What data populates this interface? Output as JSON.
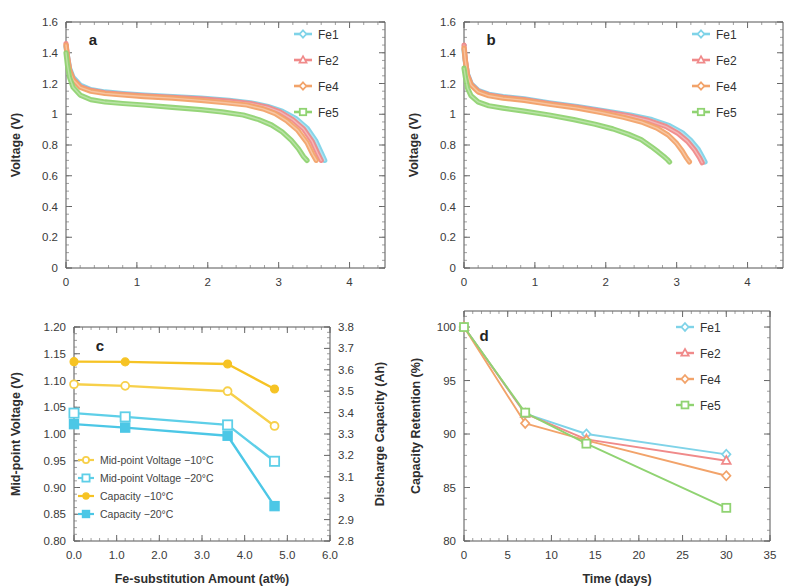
{
  "figure": {
    "panels": [
      "a",
      "b",
      "c",
      "d"
    ]
  },
  "colors": {
    "fe1": "#7fd3e8",
    "fe2": "#f08a8a",
    "fe4": "#f2a36a",
    "fe5": "#90d372",
    "midpoint_10": "#f7d04a",
    "midpoint_20": "#5ecfe8",
    "capacity_10": "#f6c324",
    "capacity_20": "#4cc7e6",
    "axis": "#555555",
    "text": "#333333"
  },
  "panel_a": {
    "letter": "a",
    "legend": [
      "Fe1",
      "Fe2",
      "Fe4",
      "Fe5"
    ],
    "chart_data": {
      "type": "line",
      "title": "",
      "xlabel": "Discharge Capacity (Ah)",
      "ylabel": "Voltage (V)",
      "xlim": [
        0,
        4.5
      ],
      "ylim": [
        0,
        1.6
      ],
      "xticks": [
        0,
        1,
        2,
        3,
        4
      ],
      "xtick_labels": [
        "0",
        "1",
        "2",
        "3",
        "4"
      ],
      "yticks": [
        0,
        0.2,
        0.4,
        0.6,
        0.8,
        1.0,
        1.2,
        1.4,
        1.6
      ],
      "ytick_labels": [
        "0",
        "0.2",
        "0.4",
        "0.6",
        "0.8",
        "1",
        "1.2",
        "1.4",
        "1.6"
      ],
      "grid": false,
      "legend_position": "top-right",
      "series": [
        {
          "name": "Fe1",
          "color": "#7fd3e8",
          "x": [
            0.0,
            0.02,
            0.05,
            0.1,
            0.2,
            0.35,
            0.55,
            0.8,
            1.1,
            1.5,
            1.9,
            2.3,
            2.6,
            2.85,
            3.05,
            3.25,
            3.4,
            3.52,
            3.6,
            3.65
          ],
          "y": [
            1.44,
            1.38,
            1.3,
            1.24,
            1.19,
            1.16,
            1.145,
            1.135,
            1.125,
            1.115,
            1.105,
            1.09,
            1.075,
            1.05,
            1.02,
            0.97,
            0.91,
            0.83,
            0.75,
            0.7
          ]
        },
        {
          "name": "Fe2",
          "color": "#f08a8a",
          "x": [
            0.0,
            0.02,
            0.05,
            0.1,
            0.2,
            0.35,
            0.55,
            0.8,
            1.1,
            1.5,
            1.9,
            2.3,
            2.6,
            2.85,
            3.02,
            3.2,
            3.35,
            3.47,
            3.55,
            3.6
          ],
          "y": [
            1.46,
            1.38,
            1.29,
            1.23,
            1.18,
            1.155,
            1.14,
            1.13,
            1.12,
            1.11,
            1.1,
            1.085,
            1.07,
            1.045,
            1.015,
            0.965,
            0.905,
            0.825,
            0.745,
            0.7
          ]
        },
        {
          "name": "Fe4",
          "color": "#f2a36a",
          "x": [
            0.0,
            0.02,
            0.05,
            0.1,
            0.2,
            0.35,
            0.55,
            0.8,
            1.1,
            1.5,
            1.9,
            2.25,
            2.55,
            2.78,
            2.95,
            3.12,
            3.27,
            3.4,
            3.48,
            3.53
          ],
          "y": [
            1.45,
            1.37,
            1.285,
            1.225,
            1.175,
            1.15,
            1.135,
            1.125,
            1.115,
            1.105,
            1.09,
            1.075,
            1.06,
            1.035,
            1.005,
            0.955,
            0.895,
            0.815,
            0.74,
            0.7
          ]
        },
        {
          "name": "Fe5",
          "color": "#90d372",
          "x": [
            0.0,
            0.02,
            0.05,
            0.1,
            0.2,
            0.35,
            0.55,
            0.8,
            1.1,
            1.5,
            1.9,
            2.2,
            2.5,
            2.72,
            2.9,
            3.05,
            3.18,
            3.28,
            3.35,
            3.4
          ],
          "y": [
            1.4,
            1.32,
            1.24,
            1.175,
            1.125,
            1.095,
            1.08,
            1.07,
            1.06,
            1.045,
            1.03,
            1.015,
            0.995,
            0.965,
            0.93,
            0.885,
            0.83,
            0.775,
            0.725,
            0.7
          ]
        }
      ]
    }
  },
  "panel_b": {
    "letter": "b",
    "legend": [
      "Fe1",
      "Fe2",
      "Fe4",
      "Fe5"
    ],
    "chart_data": {
      "type": "line",
      "title": "",
      "xlabel": "Discharge Capacity (Ah)",
      "ylabel": "Voltage (V)",
      "xlim": [
        0,
        4.5
      ],
      "ylim": [
        0,
        1.6
      ],
      "xticks": [
        0,
        1,
        2,
        3,
        4
      ],
      "xtick_labels": [
        "0",
        "1",
        "2",
        "3",
        "4"
      ],
      "yticks": [
        0,
        0.2,
        0.4,
        0.6,
        0.8,
        1.0,
        1.2,
        1.4,
        1.6
      ],
      "ytick_labels": [
        "0",
        "0.2",
        "0.4",
        "0.6",
        "0.8",
        "1",
        "1.2",
        "1.4",
        "1.6"
      ],
      "grid": false,
      "legend_position": "top-right",
      "series": [
        {
          "name": "Fe1",
          "color": "#7fd3e8",
          "x": [
            0.0,
            0.02,
            0.05,
            0.1,
            0.2,
            0.35,
            0.55,
            0.85,
            1.2,
            1.6,
            2.0,
            2.35,
            2.65,
            2.9,
            3.08,
            3.2,
            3.3,
            3.36,
            3.4
          ],
          "y": [
            1.42,
            1.34,
            1.26,
            1.2,
            1.155,
            1.13,
            1.115,
            1.1,
            1.075,
            1.05,
            1.02,
            0.995,
            0.965,
            0.925,
            0.88,
            0.83,
            0.775,
            0.725,
            0.69
          ]
        },
        {
          "name": "Fe2",
          "color": "#f08a8a",
          "x": [
            0.0,
            0.02,
            0.05,
            0.1,
            0.2,
            0.35,
            0.55,
            0.85,
            1.2,
            1.6,
            2.0,
            2.32,
            2.6,
            2.85,
            3.02,
            3.15,
            3.25,
            3.32,
            3.36
          ],
          "y": [
            1.45,
            1.35,
            1.255,
            1.195,
            1.15,
            1.125,
            1.11,
            1.095,
            1.07,
            1.045,
            1.015,
            0.99,
            0.96,
            0.92,
            0.875,
            0.825,
            0.77,
            0.72,
            0.685
          ]
        },
        {
          "name": "Fe4",
          "color": "#f2a36a",
          "x": [
            0.0,
            0.02,
            0.05,
            0.1,
            0.2,
            0.35,
            0.55,
            0.85,
            1.2,
            1.6,
            1.95,
            2.25,
            2.5,
            2.72,
            2.88,
            3.0,
            3.08,
            3.14,
            3.18
          ],
          "y": [
            1.43,
            1.345,
            1.25,
            1.19,
            1.145,
            1.12,
            1.105,
            1.09,
            1.065,
            1.04,
            1.01,
            0.98,
            0.95,
            0.91,
            0.865,
            0.81,
            0.76,
            0.715,
            0.69
          ]
        },
        {
          "name": "Fe5",
          "color": "#90d372",
          "x": [
            0.0,
            0.02,
            0.05,
            0.1,
            0.2,
            0.35,
            0.55,
            0.85,
            1.2,
            1.55,
            1.85,
            2.1,
            2.32,
            2.5,
            2.64,
            2.74,
            2.82,
            2.87,
            2.9
          ],
          "y": [
            1.3,
            1.24,
            1.17,
            1.12,
            1.08,
            1.055,
            1.04,
            1.02,
            0.995,
            0.965,
            0.935,
            0.905,
            0.87,
            0.835,
            0.79,
            0.755,
            0.725,
            0.705,
            0.69
          ]
        }
      ]
    }
  },
  "panel_c": {
    "letter": "c",
    "legend": [
      "Mid-point Voltage −10°C",
      "Mid-point Voltage −20°C",
      "Capacity −10°C",
      "Capacity −20°C"
    ],
    "chart_data": {
      "type": "line",
      "title": "",
      "xlabel": "Fe-substitution Amount (at%)",
      "ylabel": "Mid-point Voltage (V)",
      "ylabel_right": "Discharge Capacity (Ah)",
      "xlim": [
        0,
        6.0
      ],
      "ylim": [
        0.8,
        1.2
      ],
      "ylim_right": [
        2.8,
        3.8
      ],
      "xticks": [
        0.0,
        1.0,
        2.0,
        3.0,
        4.0,
        5.0,
        6.0
      ],
      "xtick_labels": [
        "0.0",
        "1.0",
        "2.0",
        "3.0",
        "4.0",
        "5.0",
        "6.0"
      ],
      "yticks": [
        0.8,
        0.85,
        0.9,
        0.95,
        1.0,
        1.05,
        1.1,
        1.15,
        1.2
      ],
      "ytick_labels": [
        "0.80",
        "0.85",
        "0.90",
        "0.95",
        "1.00",
        "1.05",
        "1.10",
        "1.15",
        "1.20"
      ],
      "yticks_right": [
        2.8,
        2.9,
        3.0,
        3.1,
        3.2,
        3.3,
        3.4,
        3.5,
        3.6,
        3.7,
        3.8
      ],
      "ytick_labels_right": [
        "2.8",
        "2.9",
        "3",
        "3.1",
        "3.2",
        "3.3",
        "3.4",
        "3.5",
        "3.6",
        "3.7",
        "3.8"
      ],
      "grid": false,
      "legend_position": "lower-left",
      "x": [
        0.0,
        1.2,
        3.6,
        4.7
      ],
      "series": [
        {
          "name": "Mid-point Voltage −10°C",
          "axis": "left",
          "color": "#f7d04a",
          "marker": "open-circle",
          "values": [
            1.093,
            1.09,
            1.08,
            1.015
          ]
        },
        {
          "name": "Mid-point Voltage −20°C",
          "axis": "left",
          "color": "#5ecfe8",
          "marker": "open-square",
          "values": [
            1.039,
            1.032,
            1.017,
            0.949
          ]
        },
        {
          "name": "Capacity −10°C",
          "axis": "right",
          "color": "#f6c324",
          "marker": "filled-circle",
          "values": [
            3.638,
            3.637,
            3.627,
            3.51
          ]
        },
        {
          "name": "Capacity −20°C",
          "axis": "right",
          "color": "#4cc7e6",
          "marker": "filled-square",
          "values": [
            3.346,
            3.33,
            3.292,
            2.963
          ]
        }
      ]
    }
  },
  "panel_d": {
    "letter": "d",
    "legend": [
      "Fe1",
      "Fe2",
      "Fe4",
      "Fe5"
    ],
    "chart_data": {
      "type": "line",
      "title": "",
      "xlabel": "Time (days)",
      "ylabel": "Capacity Retention (%)",
      "xlim": [
        0,
        35
      ],
      "ylim": [
        80,
        101.5
      ],
      "xticks": [
        0,
        5,
        10,
        15,
        20,
        25,
        30,
        35
      ],
      "xtick_labels": [
        "0",
        "5",
        "10",
        "15",
        "20",
        "25",
        "30",
        "35"
      ],
      "yticks": [
        80,
        85,
        90,
        95,
        100
      ],
      "ytick_labels": [
        "80",
        "85",
        "90",
        "95",
        "100"
      ],
      "grid": false,
      "legend_position": "top-right",
      "x": [
        0,
        7,
        14,
        30
      ],
      "series": [
        {
          "name": "Fe1",
          "color": "#7fd3e8",
          "marker": "open-diamond",
          "values": [
            100,
            91.9,
            90.0,
            88.1
          ]
        },
        {
          "name": "Fe2",
          "color": "#f08a8a",
          "marker": "open-triangle",
          "values": [
            100,
            91.9,
            89.5,
            87.5
          ]
        },
        {
          "name": "Fe4",
          "color": "#f2a36a",
          "marker": "open-diamond",
          "values": [
            100,
            91.0,
            89.4,
            86.1
          ]
        },
        {
          "name": "Fe5",
          "color": "#90d372",
          "marker": "open-square",
          "values": [
            100,
            92.0,
            89.1,
            83.1
          ]
        }
      ]
    }
  }
}
